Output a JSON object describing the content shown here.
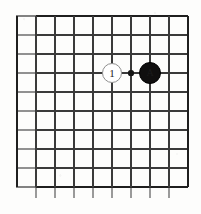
{
  "figure": {
    "kind": "go-board-diagram",
    "width": 201,
    "height": 214,
    "background_color": "#fdfdfc",
    "line_color": "#3a3a3a",
    "edge_line_color": "#1f1f1f"
  },
  "board": {
    "columns": 10,
    "rows": 10,
    "cell_size": 19,
    "origin_x": 17,
    "origin_y": 16,
    "vertical_line_x": [
      17,
      36,
      55,
      74,
      93,
      112,
      131,
      150,
      169,
      188
    ],
    "horizontal_line_y": [
      16,
      35,
      54,
      73,
      92,
      111,
      130,
      149,
      168,
      187
    ],
    "edges": {
      "top": true,
      "right": true,
      "bottom": true,
      "left_open": true,
      "vertical_overhang_bottom": 11
    }
  },
  "star_points": [
    {
      "name": "star-point-center",
      "x": 131,
      "y": 73,
      "radius": 2.6,
      "color": "#151515"
    }
  ],
  "stones": [
    {
      "id": "white-stone-1",
      "color": "white",
      "label": "1",
      "x": 112,
      "y": 73,
      "radius": 10,
      "fill": "#ffffff",
      "outline": "#8f8f8f"
    },
    {
      "id": "black-stone-a",
      "color": "black",
      "label": "A",
      "x": 150,
      "y": 73,
      "radius": 11,
      "fill": "#100f0f",
      "outline": "#000000"
    }
  ]
}
